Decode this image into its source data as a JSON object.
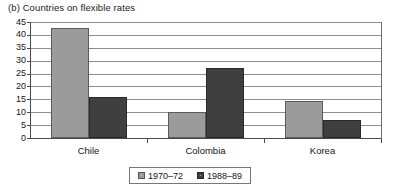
{
  "chart_data": {
    "type": "bar",
    "title": "(b) Countries on flexible rates",
    "xlabel": "",
    "ylabel": "",
    "ylim": [
      0,
      45
    ],
    "yticks": [
      0,
      5,
      10,
      15,
      20,
      25,
      30,
      35,
      40,
      45
    ],
    "ytick_labels": [
      "0",
      "5",
      "10",
      "15",
      "20",
      "25",
      "30",
      "35",
      "40",
      "45"
    ],
    "grid": true,
    "grid_axis": "y",
    "legend_position": "bottom-center",
    "categories": [
      "Chile",
      "Colombia",
      "Korea"
    ],
    "series": [
      {
        "name": "1970–72",
        "color": "#9b9b9b",
        "values": [
          42.7,
          10.1,
          14.4
        ]
      },
      {
        "name": "1988–89",
        "color": "#3f3f3f",
        "values": [
          16.0,
          27.2,
          7.0
        ]
      }
    ]
  },
  "legend": {
    "entries": [
      {
        "label": "1970–72",
        "swatch": "legend-swatch-light-gray"
      },
      {
        "label": "1988–89",
        "swatch": "legend-swatch-dark-gray"
      }
    ]
  },
  "colors": {
    "series_1970_72": "#9b9b9b",
    "series_1988_89": "#3f3f3f",
    "gridline": "#8d8d8d",
    "axis": "#4a4a4a",
    "background": "#ffffff",
    "text": "#151515"
  }
}
